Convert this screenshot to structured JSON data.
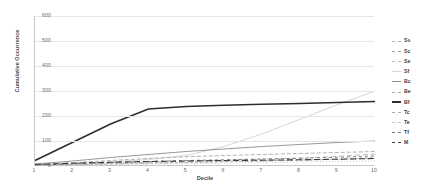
{
  "chart_data": {
    "type": "line",
    "title": "",
    "xlabel": "Decile",
    "ylabel": "Cumulative Occurrence",
    "x": [
      1,
      2,
      3,
      4,
      5,
      6,
      7,
      8,
      9,
      10
    ],
    "xlim": [
      1,
      10
    ],
    "ylim": [
      0,
      600
    ],
    "yticks": [
      0,
      100,
      200,
      300,
      400,
      500,
      600
    ],
    "xticks": [
      1,
      2,
      3,
      4,
      5,
      6,
      7,
      8,
      9,
      10
    ],
    "grid": true,
    "legend_position": "right",
    "series": [
      {
        "name": "Ss",
        "color": "#b4b4b4",
        "dash": "2,2",
        "width": 0.8,
        "values": [
          3,
          6,
          9,
          12,
          15,
          18,
          21,
          24,
          27,
          30
        ]
      },
      {
        "name": "Sc",
        "color": "#9e9e9e",
        "dash": "3,2",
        "width": 0.8,
        "values": [
          2,
          5,
          8,
          11,
          14,
          17,
          20,
          23,
          27,
          32
        ]
      },
      {
        "name": "Se",
        "color": "#bdbdbd",
        "dash": "1,2",
        "width": 0.8,
        "values": [
          2,
          4,
          6,
          8,
          10,
          12,
          14,
          16,
          18,
          20
        ]
      },
      {
        "name": "Sf",
        "color": "#d6d6d6",
        "dash": "none",
        "width": 1.0,
        "values": [
          4,
          9,
          16,
          26,
          42,
          78,
          128,
          186,
          245,
          300
        ]
      },
      {
        "name": "Bc",
        "color": "#8c8c8c",
        "dash": "none",
        "width": 0.9,
        "values": [
          8,
          20,
          34,
          46,
          58,
          68,
          78,
          86,
          94,
          100
        ]
      },
      {
        "name": "Be",
        "color": "#a8a8a8",
        "dash": "4,2",
        "width": 0.9,
        "values": [
          5,
          13,
          22,
          30,
          37,
          42,
          46,
          50,
          54,
          58
        ]
      },
      {
        "name": "Bf",
        "color": "#2e2e2e",
        "dash": "none",
        "width": 1.6,
        "values": [
          22,
          95,
          168,
          228,
          238,
          243,
          247,
          250,
          254,
          258
        ]
      },
      {
        "name": "Tc",
        "color": "#b0b0b0",
        "dash": "5,3",
        "width": 0.9,
        "values": [
          3,
          7,
          11,
          15,
          19,
          23,
          27,
          31,
          38,
          48
        ]
      },
      {
        "name": "Te",
        "color": "#c4c4c4",
        "dash": "2,3",
        "width": 0.8,
        "values": [
          2,
          5,
          8,
          11,
          14,
          17,
          20,
          23,
          28,
          36
        ]
      },
      {
        "name": "Tf",
        "color": "#777777",
        "dash": "3,3",
        "width": 0.9,
        "values": [
          4,
          9,
          14,
          18,
          22,
          25,
          28,
          31,
          35,
          40
        ]
      },
      {
        "name": "M",
        "color": "#3d3d3d",
        "dash": "6,3",
        "width": 1.1,
        "values": [
          6,
          11,
          15,
          18,
          20,
          22,
          23,
          25,
          27,
          30
        ]
      }
    ]
  }
}
